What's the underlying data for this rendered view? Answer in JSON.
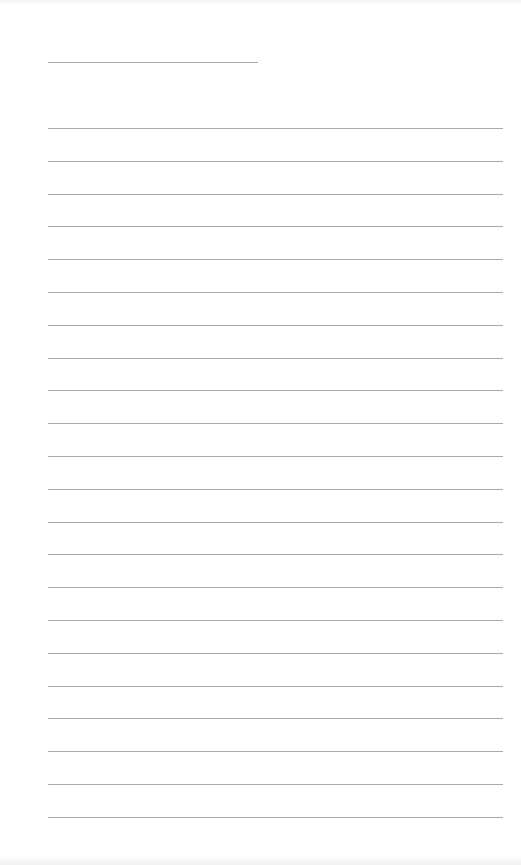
{
  "page": {
    "type": "blank lined writing sheet",
    "background_color": "#ffffff",
    "line_color": "#a9a9a9"
  },
  "header_line": {
    "x": 48,
    "y": 62,
    "width": 210
  },
  "ruled_lines": {
    "count": 22,
    "x": 48,
    "width": 455,
    "first_y": 128,
    "spacing": 32.8
  }
}
